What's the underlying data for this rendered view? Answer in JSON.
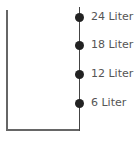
{
  "diagram": {
    "marks": [
      {
        "label": "24 Liter",
        "y": 17
      },
      {
        "label": "18 Liter",
        "y": 45
      },
      {
        "label": "12 Liter",
        "y": 74
      },
      {
        "label": "6 Liter",
        "y": 103
      }
    ],
    "line_color": "#666666",
    "mark_color": "#222222",
    "label_color": "#555555"
  }
}
